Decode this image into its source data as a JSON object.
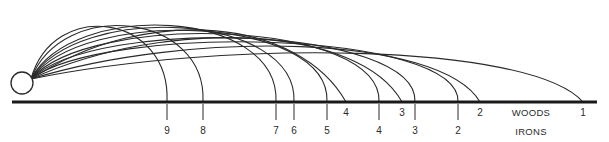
{
  "diagram": {
    "title": "",
    "ball": {
      "cx": 22,
      "cy": 83,
      "r": 11
    },
    "origin": {
      "x": 31,
      "y": 79
    },
    "ground": {
      "x1": 12,
      "x2": 597,
      "y": 102,
      "color": "#1a1a1a"
    },
    "line_color": "#2a2a2a",
    "woods_label": "WOODS",
    "irons_label": "IRONS",
    "woods_label_pos": {
      "x": 531,
      "y": 108
    },
    "irons_label_pos": {
      "x": 531,
      "y": 127
    },
    "irons": [
      {
        "club": "9",
        "land_x": 167,
        "peak_x": 95,
        "peak_y": 13,
        "c1y": 8,
        "c2y": 20
      },
      {
        "club": "8",
        "land_x": 203,
        "peak_x": 120,
        "peak_y": 10,
        "c1y": 8,
        "c2y": 18
      },
      {
        "club": "7",
        "land_x": 276,
        "peak_x": 150,
        "peak_y": 9,
        "c1y": 10,
        "c2y": 14
      },
      {
        "club": "6",
        "land_x": 294,
        "peak_x": 165,
        "peak_y": 12,
        "c1y": 12,
        "c2y": 18
      },
      {
        "club": "5",
        "land_x": 327,
        "peak_x": 180,
        "peak_y": 16,
        "c1y": 16,
        "c2y": 22
      },
      {
        "club": "4",
        "land_x": 379,
        "peak_x": 200,
        "peak_y": 21,
        "c1y": 21,
        "c2y": 26
      },
      {
        "club": "3",
        "land_x": 415,
        "peak_x": 220,
        "peak_y": 27,
        "c1y": 26,
        "c2y": 32
      },
      {
        "club": "2",
        "land_x": 458,
        "peak_x": 240,
        "peak_y": 33,
        "c1y": 33,
        "c2y": 36
      }
    ],
    "woods": [
      {
        "club": "4",
        "land_x": 346,
        "c1x": 150,
        "c1y": 2,
        "c2x": 300,
        "c2y": 20
      },
      {
        "club": "3",
        "land_x": 402,
        "c1x": 170,
        "c1y": 16,
        "c2x": 360,
        "c2y": 26
      },
      {
        "club": "2",
        "land_x": 480,
        "c1x": 190,
        "c1y": 30,
        "c2x": 440,
        "c2y": 34
      },
      {
        "club": "1",
        "land_x": 583,
        "c1x": 220,
        "c1y": 40,
        "c2x": 530,
        "c2y": 42
      }
    ],
    "iron_tick": {
      "y1": 104,
      "y2": 120,
      "label_y": 126
    },
    "wood_label_y": 108
  }
}
